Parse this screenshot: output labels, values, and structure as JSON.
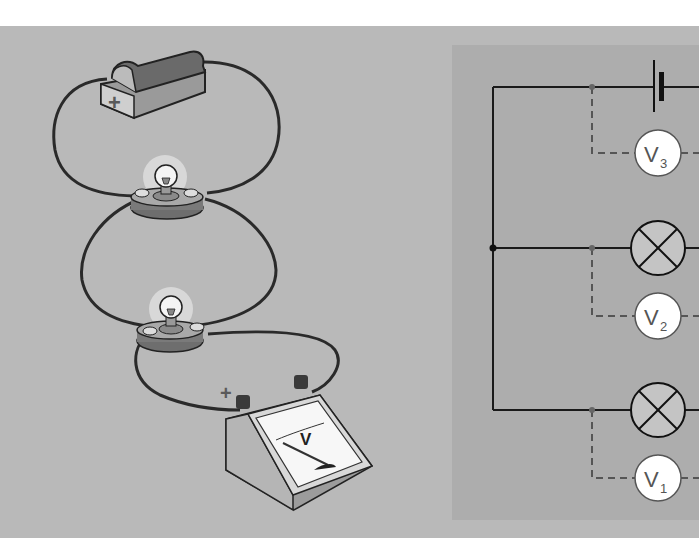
{
  "figure": {
    "left_panel": {
      "title": "Pictorial series circuit",
      "components": [
        {
          "type": "battery",
          "polarity_mark": "+"
        },
        {
          "type": "lamp",
          "index": 1,
          "state": "lit"
        },
        {
          "type": "lamp",
          "index": 2,
          "state": "lit"
        },
        {
          "type": "voltmeter",
          "dial_label": "V",
          "terminal_mark": "+"
        }
      ]
    },
    "right_panel": {
      "title": "Schematic",
      "components": [
        {
          "type": "cell-symbol",
          "position": "top"
        },
        {
          "type": "lamp-symbol",
          "position": "middle"
        },
        {
          "type": "lamp-symbol",
          "position": "bottom"
        }
      ],
      "voltmeters": [
        {
          "letter": "V",
          "sub": "3",
          "across": "cell"
        },
        {
          "letter": "V",
          "sub": "2",
          "across": "lamp-middle"
        },
        {
          "letter": "V",
          "sub": "1",
          "across": "lamp-bottom"
        }
      ]
    },
    "colors": {
      "background": "#b9b9b9",
      "schematic_box": "#adadad",
      "wire": "#1a1a1a",
      "dashed_lead": "#555555",
      "meter_fill": "#ffffff",
      "lamp_fill": "#c4c4c4"
    }
  }
}
